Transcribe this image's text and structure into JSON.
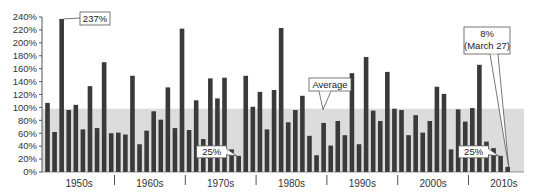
{
  "chart_data": {
    "type": "bar",
    "title": "",
    "xlabel": "",
    "ylabel": "",
    "ylim": [
      0,
      240
    ],
    "y_ticks": [
      "0%",
      "20%",
      "40%",
      "60%",
      "80%",
      "100%",
      "120%",
      "140%",
      "160%",
      "180%",
      "200%",
      "220%",
      "240%"
    ],
    "grid": false,
    "legend": null,
    "decades": [
      "1950s",
      "1960s",
      "1970s",
      "1980s",
      "1990s",
      "2000s",
      "2010s"
    ],
    "average_band": {
      "label": "Average",
      "value": 98
    },
    "series": [
      {
        "name": "Percent",
        "values_by_decade": {
          "1950s": [
            107,
            62,
            237,
            96,
            104,
            66,
            133,
            68,
            170,
            60
          ],
          "1960s": [
            61,
            58,
            149,
            43,
            64,
            94,
            81,
            131,
            68,
            222
          ],
          "1970s": [
            65,
            111,
            51,
            145,
            114,
            146,
            35,
            25,
            149,
            101
          ],
          "1980s": [
            124,
            66,
            127,
            223,
            77,
            96,
            118,
            56,
            26,
            76
          ],
          "1990s": [
            41,
            79,
            57,
            153,
            43,
            178,
            95,
            79,
            155,
            98
          ],
          "2000s": [
            96,
            57,
            88,
            61,
            79,
            132,
            121,
            35,
            97,
            78
          ],
          "2010s": [
            99,
            166,
            47,
            37,
            25,
            8
          ]
        }
      }
    ],
    "annotations": [
      {
        "text": "237%",
        "decade": "1950s",
        "index": 2
      },
      {
        "text": "25%",
        "decade": "1970s",
        "index": 7
      },
      {
        "text": "25%",
        "decade": "2010s",
        "index": 4
      },
      {
        "text": "8%",
        "subtext": "(March 27)",
        "decade": "2010s",
        "index": 5
      },
      {
        "text": "Average",
        "target": "average_band"
      }
    ],
    "colors": {
      "bar": "#3a3a3a",
      "band": "#dcdcdc",
      "axis": "#555555"
    }
  }
}
